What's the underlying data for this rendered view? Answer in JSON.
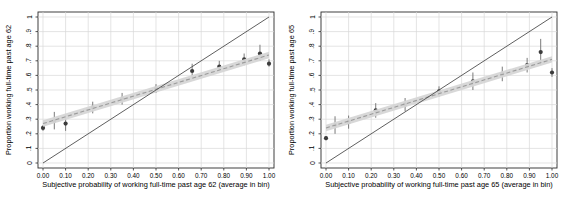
{
  "page": {
    "background": "#ffffff"
  },
  "colors": {
    "plot_border": "#2a2a2a",
    "grid": "#d9d9d9",
    "diagonal_line": "#4d4d4d",
    "fit_line": "#9b9b9b",
    "band_fill": "#d6d6d6",
    "ci_line": "#7a7a7a",
    "point_fill": "#3c3c3c",
    "text": "#000000",
    "background": "#ffffff"
  },
  "chart_data": [
    {
      "type": "scatter",
      "panel_id": "age-62",
      "xlabel": "Subjective probability of working full-time past age 62 (average in bin)",
      "ylabel": "Proportion working full-time past age 62",
      "xlim": [
        0,
        1
      ],
      "ylim": [
        0,
        1
      ],
      "grid": true,
      "legend_position": "none",
      "x_tick_labels": [
        "0.00",
        "0.10",
        "0.20",
        "0.30",
        "0.40",
        "0.50",
        "0.60",
        "0.70",
        "0.80",
        "0.90",
        "1.00"
      ],
      "y_tick_labels": [
        "0",
        ".1",
        ".2",
        ".3",
        ".4",
        ".5",
        ".6",
        ".7",
        ".8",
        ".9",
        "1"
      ],
      "x_tick_values": [
        0,
        0.1,
        0.2,
        0.3,
        0.4,
        0.5,
        0.6,
        0.7,
        0.8,
        0.9,
        1
      ],
      "y_tick_values": [
        0,
        0.1,
        0.2,
        0.3,
        0.4,
        0.5,
        0.6,
        0.7,
        0.8,
        0.9,
        1
      ],
      "series": [
        {
          "name": "binned-means-95ci",
          "kind": "scatter-error",
          "x": [
            0.0,
            0.05,
            0.1,
            0.22,
            0.35,
            0.5,
            0.66,
            0.78,
            0.89,
            0.96,
            1.0
          ],
          "y": [
            0.24,
            0.29,
            0.27,
            0.38,
            0.44,
            0.51,
            0.63,
            0.66,
            0.71,
            0.75,
            0.68
          ],
          "lo": [
            0.22,
            0.23,
            0.22,
            0.34,
            0.4,
            0.48,
            0.59,
            0.63,
            0.67,
            0.7,
            0.66
          ],
          "hi": [
            0.26,
            0.35,
            0.33,
            0.42,
            0.48,
            0.54,
            0.68,
            0.7,
            0.75,
            0.81,
            0.71
          ]
        },
        {
          "name": "linear-fit-with-band",
          "kind": "line-band",
          "x": [
            0,
            1
          ],
          "y": [
            0.27,
            0.74
          ],
          "band_halfwidth": 0.022
        },
        {
          "name": "45-degree-line",
          "kind": "line",
          "x": [
            0,
            1
          ],
          "y": [
            0,
            1
          ]
        }
      ]
    },
    {
      "type": "scatter",
      "panel_id": "age-65",
      "xlabel": "Subjective probability of working full-time past age 65 (average in bin)",
      "ylabel": "Proportion working full-time past age 65",
      "xlim": [
        0,
        1
      ],
      "ylim": [
        0,
        1
      ],
      "grid": true,
      "legend_position": "none",
      "x_tick_labels": [
        "0.00",
        "0.10",
        "0.20",
        "0.30",
        "0.40",
        "0.50",
        "0.60",
        "0.70",
        "0.80",
        "0.90",
        "1.00"
      ],
      "y_tick_labels": [
        "0",
        ".1",
        ".2",
        ".3",
        ".4",
        ".5",
        ".6",
        ".7",
        ".8",
        ".9",
        "1"
      ],
      "x_tick_values": [
        0,
        0.1,
        0.2,
        0.3,
        0.4,
        0.5,
        0.6,
        0.7,
        0.8,
        0.9,
        1
      ],
      "y_tick_values": [
        0,
        0.1,
        0.2,
        0.3,
        0.4,
        0.5,
        0.6,
        0.7,
        0.8,
        0.9,
        1
      ],
      "series": [
        {
          "name": "binned-means-95ci",
          "kind": "scatter-error",
          "x": [
            0.0,
            0.04,
            0.1,
            0.22,
            0.35,
            0.5,
            0.65,
            0.78,
            0.89,
            0.95,
            1.0
          ],
          "y": [
            0.17,
            0.26,
            0.28,
            0.36,
            0.4,
            0.49,
            0.56,
            0.61,
            0.67,
            0.76,
            0.62
          ],
          "lo": [
            0.155,
            0.2,
            0.235,
            0.31,
            0.355,
            0.455,
            0.5,
            0.56,
            0.62,
            0.67,
            0.59
          ],
          "hi": [
            0.185,
            0.32,
            0.325,
            0.41,
            0.445,
            0.525,
            0.62,
            0.66,
            0.72,
            0.85,
            0.65
          ]
        },
        {
          "name": "linear-fit-with-band",
          "kind": "line-band",
          "x": [
            0,
            1
          ],
          "y": [
            0.24,
            0.71
          ],
          "band_halfwidth": 0.022
        },
        {
          "name": "45-degree-line",
          "kind": "line",
          "x": [
            0,
            1
          ],
          "y": [
            0,
            1
          ]
        }
      ]
    }
  ]
}
